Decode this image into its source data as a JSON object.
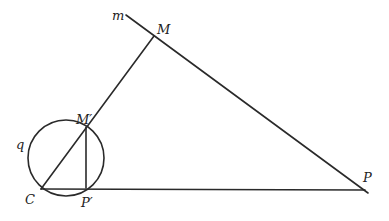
{
  "diagram": {
    "labels": {
      "m": "m",
      "M": "M",
      "M_prime": "M′",
      "q": "q",
      "C": "C",
      "P_prime": "P′",
      "P": "P"
    },
    "points": {
      "m_start": [
        126,
        15
      ],
      "M": [
        154,
        36
      ],
      "P": [
        366,
        192
      ],
      "C": [
        41,
        189
      ],
      "M_prime": [
        86,
        127
      ],
      "P_prime": [
        87,
        188
      ]
    },
    "circle_q": {
      "cx": 66,
      "cy": 158,
      "r": 38
    },
    "colors": {
      "stroke": "#2a2a2a",
      "background": "#ffffff"
    }
  }
}
